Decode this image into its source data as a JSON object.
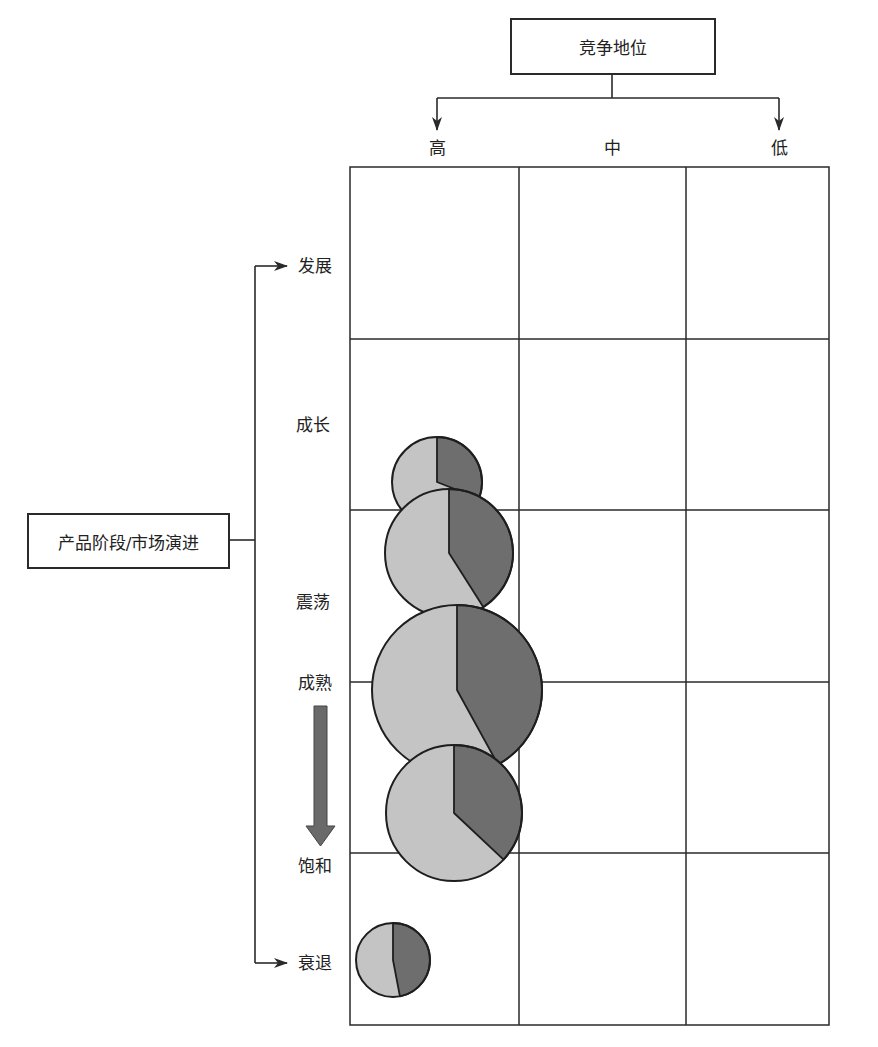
{
  "top_axis": {
    "title": "竞争地位",
    "columns": [
      "高",
      "中",
      "低"
    ]
  },
  "left_axis": {
    "title": "产品阶段/市场演进",
    "rows": [
      "发展",
      "成长",
      "震荡",
      "成熟",
      "饱和",
      "衰退"
    ]
  },
  "trend_arrow": {
    "direction": "down",
    "from": "成熟",
    "to": "饱和"
  },
  "colors": {
    "line": "#2a2a2a",
    "slice_light": "#c4c4c4",
    "slice_dark": "#6e6e6e",
    "arrow_fill": "#6a6a6a"
  },
  "bubbles": [
    {
      "id": "b1",
      "column": "高",
      "stage": "成长/震荡之间",
      "cx": 437,
      "cy": 482,
      "r": 45,
      "dark_share": 0.31
    },
    {
      "id": "b2",
      "column": "高",
      "stage": "震荡上方",
      "cx": 449,
      "cy": 553,
      "r": 64,
      "dark_share": 0.41
    },
    {
      "id": "b3",
      "column": "高",
      "stage": "成熟",
      "cx": 457,
      "cy": 690,
      "r": 85,
      "dark_share": 0.42
    },
    {
      "id": "b4",
      "column": "高",
      "stage": "成熟/饱和之间",
      "cx": 454,
      "cy": 813,
      "r": 68,
      "dark_share": 0.37
    },
    {
      "id": "b5",
      "column": "高",
      "stage": "衰退",
      "cx": 393,
      "cy": 960,
      "r": 37,
      "dark_share": 0.47
    }
  ]
}
